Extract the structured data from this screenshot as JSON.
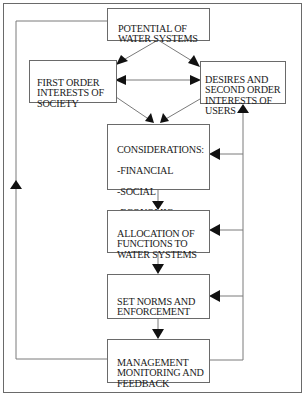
{
  "diagram": {
    "title": "",
    "frame_color": "#6a6a6a",
    "line_color": "#7a7a7a",
    "arrow_color": "#111111",
    "nodes": {
      "potential": {
        "label": "POTENTIAL OF\nWATER SYSTEMS"
      },
      "first_order": {
        "label": "FIRST ORDER\nINTERESTS OF\nSOCIETY"
      },
      "desires": {
        "label": "DESIRES AND\nSECOND ORDER\nINTERESTS OF\nUSERS"
      },
      "considerations": {
        "label": "CONSIDERATIONS:",
        "items": [
          "-FINANCIAL",
          "-SOCIAL",
          "-ECONOMIC",
          "-ENVIRONMENTAL"
        ]
      },
      "allocation": {
        "label": "ALLOCATION OF\nFUNCTIONS TO\nWATER SYSTEMS"
      },
      "set_norms": {
        "label": "SET NORMS AND\nENFORCEMENT"
      },
      "management": {
        "label": "MANAGEMENT\nMONITORING AND\nFEEDBACK"
      }
    },
    "edges": [
      {
        "from": "potential",
        "to": "first_order"
      },
      {
        "from": "potential",
        "to": "desires"
      },
      {
        "from": "first_order",
        "to": "desires",
        "bidirectional": true
      },
      {
        "from": "first_order",
        "to": "considerations"
      },
      {
        "from": "desires",
        "to": "considerations"
      },
      {
        "from": "considerations",
        "to": "allocation"
      },
      {
        "from": "allocation",
        "to": "set_norms"
      },
      {
        "from": "set_norms",
        "to": "management"
      },
      {
        "from": "management",
        "to": "potential",
        "type": "feedback-left"
      },
      {
        "from": "management",
        "to": "desires",
        "type": "feedback-right"
      },
      {
        "from": "management",
        "to": "considerations",
        "type": "feedback-right"
      },
      {
        "from": "management",
        "to": "allocation",
        "type": "feedback-right"
      },
      {
        "from": "management",
        "to": "set_norms",
        "type": "feedback-right"
      }
    ]
  }
}
